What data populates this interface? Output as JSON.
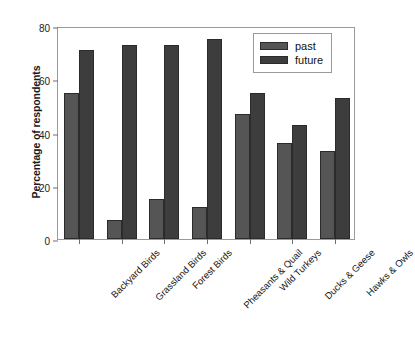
{
  "chart_data": {
    "type": "bar",
    "title": "",
    "xlabel": "",
    "ylabel": "Percentage of respondents",
    "ylim": [
      0,
      80
    ],
    "yticks": [
      0,
      20,
      40,
      60,
      80
    ],
    "grid": false,
    "legend_position": "top-right",
    "categories": [
      "Backyard Birds",
      "Grassland Birds",
      "Forest Birds",
      "Pheasants & Quail",
      "Wild Turkeys",
      "Ducks & Geese",
      "Hawks & Owls"
    ],
    "series": [
      {
        "name": "past",
        "color": "#555555",
        "values": [
          55,
          7,
          15,
          12,
          47,
          36,
          33
        ]
      },
      {
        "name": "future",
        "color": "#3d3d3d",
        "values": [
          71,
          73,
          73,
          75,
          55,
          43,
          53
        ]
      }
    ]
  },
  "legend": {
    "entries": [
      {
        "label": "past"
      },
      {
        "label": "future"
      }
    ]
  },
  "caption": {
    "text": "clipped caption line"
  }
}
